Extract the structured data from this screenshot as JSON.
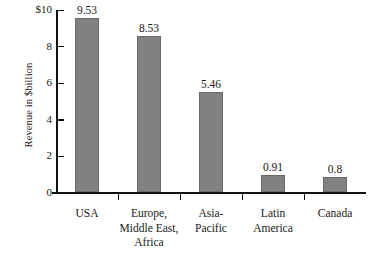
{
  "chart_data": {
    "type": "bar",
    "title": "",
    "xlabel": "",
    "ylabel": "Revenue in $billion",
    "ylim": [
      0,
      10
    ],
    "ytick_labels": [
      "0",
      "2",
      "4",
      "6",
      "8",
      "$10"
    ],
    "ytick_values": [
      0,
      2,
      4,
      6,
      8,
      10
    ],
    "grid": false,
    "legend": null,
    "categories": [
      "USA",
      "Europe,\nMiddle East,\nAfrica",
      "Asia-\nPacific",
      "Latin\nAmerica",
      "Canada"
    ],
    "values": [
      9.53,
      8.53,
      5.46,
      0.91,
      0.8
    ],
    "value_labels": [
      "9.53",
      "8.53",
      "5.46",
      "0.91",
      "0.8"
    ],
    "bar_color": "#818181",
    "bar_border_color": "#6a6a6a",
    "axis_color": "#111111",
    "background_color": "#ffffff"
  }
}
